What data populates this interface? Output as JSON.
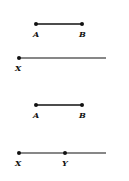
{
  "diagram": {
    "figure1": {
      "segment": {
        "start_label": "A",
        "end_label": "B"
      },
      "ray": {
        "start_label": "X"
      }
    },
    "figure2": {
      "segment": {
        "start_label": "A",
        "end_label": "B"
      },
      "ray": {
        "start_label": "X",
        "point_label": "Y"
      }
    },
    "colors": {
      "line": "#111111",
      "background": "#ffffff"
    }
  }
}
